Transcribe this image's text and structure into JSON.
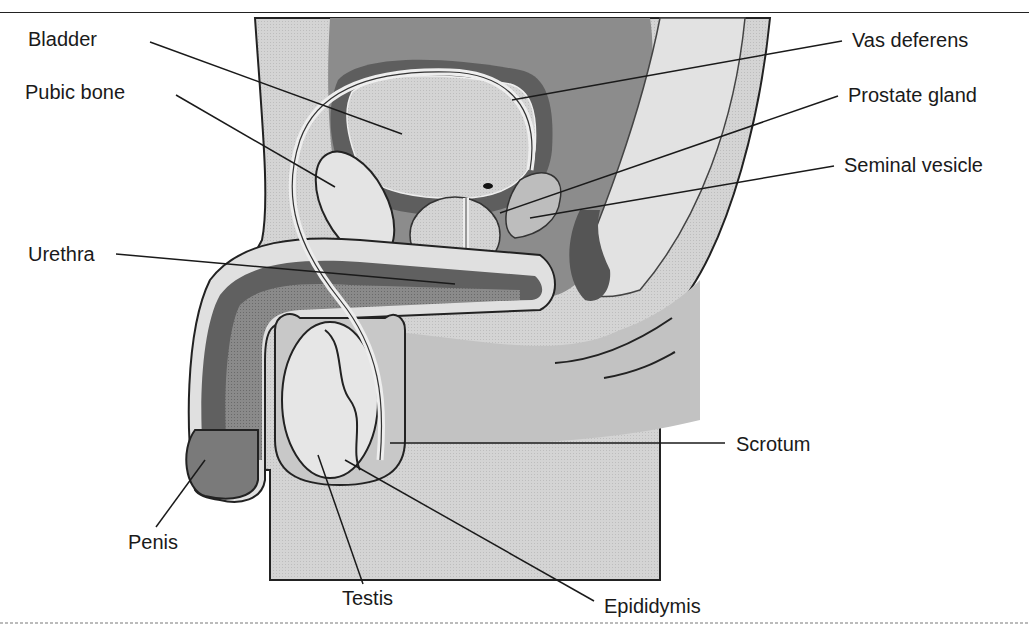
{
  "diagram": {
    "title_fragment": "",
    "style": "greyscale sagittal anatomical illustration with leader-line labels",
    "colors": {
      "background": "#ffffff",
      "light_tissue": "#d6d6d6",
      "mid_tissue": "#a8a8a8",
      "dark_tissue": "#6e6e6e",
      "skin": "#c9c9c9",
      "outline": "#222222",
      "label_text": "#1a1a1a"
    },
    "labels": [
      {
        "id": "bladder",
        "text": "Bladder",
        "side": "left"
      },
      {
        "id": "pubic-bone",
        "text": "Pubic bone",
        "side": "left"
      },
      {
        "id": "urethra",
        "text": "Urethra",
        "side": "left"
      },
      {
        "id": "penis",
        "text": "Penis",
        "side": "left"
      },
      {
        "id": "testis",
        "text": "Testis",
        "side": "bottom"
      },
      {
        "id": "epididymis",
        "text": "Epididymis",
        "side": "bottom"
      },
      {
        "id": "scrotum",
        "text": "Scrotum",
        "side": "right"
      },
      {
        "id": "seminal-vesicle",
        "text": "Seminal vesicle",
        "side": "right"
      },
      {
        "id": "prostate-gland",
        "text": "Prostate gland",
        "side": "right"
      },
      {
        "id": "vas-deferens",
        "text": "Vas deferens",
        "side": "right"
      }
    ]
  }
}
